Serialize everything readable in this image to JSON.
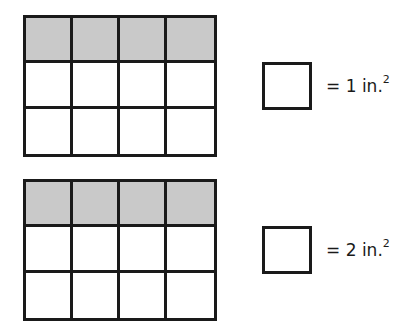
{
  "figures": [
    {
      "id": "grid-1",
      "rows": 3,
      "cols": 4,
      "shaded_rows": [
        0
      ],
      "legend": {
        "value": "1",
        "text_prefix": "= ",
        "unit": " in.",
        "exponent": "2"
      }
    },
    {
      "id": "grid-2",
      "rows": 3,
      "cols": 4,
      "shaded_rows": [
        0
      ],
      "legend": {
        "value": "2",
        "text_prefix": "= ",
        "unit": " in.",
        "exponent": "2"
      }
    }
  ],
  "colors": {
    "line": "#1a1a1a",
    "shade": "#c9c9c9",
    "background": "#ffffff"
  }
}
